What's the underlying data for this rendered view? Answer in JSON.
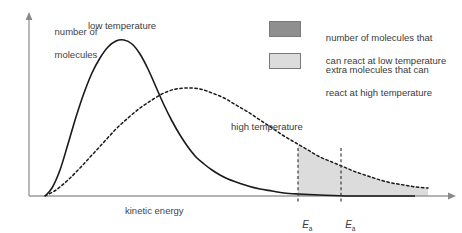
{
  "chart_data": {
    "type": "line",
    "title": "",
    "xlabel": "kinetic energy",
    "ylabel_line1": "number of",
    "ylabel_line2": "molecules",
    "grid": false,
    "legend_position": "top-right",
    "series": [
      {
        "name": "low temperature",
        "style": "solid",
        "color": "#1a1a1a",
        "label": "low temperature",
        "description": "Maxwell-Boltzmann distribution at low temperature: tall narrow peak at low kinetic energy",
        "peak_x": 118,
        "peak_y": 40,
        "points": [
          [
            45,
            196
          ],
          [
            52,
            188
          ],
          [
            60,
            170
          ],
          [
            68,
            144
          ],
          [
            76,
            117
          ],
          [
            84,
            93
          ],
          [
            92,
            73
          ],
          [
            100,
            58
          ],
          [
            108,
            47
          ],
          [
            116,
            41
          ],
          [
            124,
            40
          ],
          [
            132,
            44
          ],
          [
            140,
            54
          ],
          [
            148,
            69
          ],
          [
            156,
            87
          ],
          [
            164,
            105
          ],
          [
            172,
            121
          ],
          [
            180,
            135
          ],
          [
            188,
            147
          ],
          [
            196,
            157
          ],
          [
            204,
            164
          ],
          [
            212,
            170
          ],
          [
            220,
            175
          ],
          [
            228,
            179
          ],
          [
            236,
            182
          ],
          [
            248,
            186
          ],
          [
            260,
            189
          ],
          [
            272,
            191
          ],
          [
            284,
            193
          ],
          [
            298,
            194
          ],
          [
            320,
            195
          ],
          [
            350,
            196
          ],
          [
            380,
            196
          ],
          [
            415,
            196
          ]
        ]
      },
      {
        "name": "high temperature",
        "style": "dashed",
        "color": "#1a1a1a",
        "label": "high temperature",
        "description": "Maxwell-Boltzmann distribution at high temperature: lower broader peak shifted to higher kinetic energy",
        "peak_x": 175,
        "peak_y": 88,
        "points": [
          [
            45,
            196
          ],
          [
            56,
            190
          ],
          [
            68,
            180
          ],
          [
            80,
            168
          ],
          [
            92,
            155
          ],
          [
            104,
            142
          ],
          [
            116,
            129
          ],
          [
            128,
            118
          ],
          [
            140,
            108
          ],
          [
            152,
            100
          ],
          [
            164,
            93
          ],
          [
            176,
            89
          ],
          [
            188,
            88
          ],
          [
            200,
            89
          ],
          [
            212,
            93
          ],
          [
            224,
            98
          ],
          [
            236,
            105
          ],
          [
            248,
            112
          ],
          [
            260,
            120
          ],
          [
            272,
            128
          ],
          [
            284,
            136
          ],
          [
            296,
            143
          ],
          [
            308,
            150
          ],
          [
            320,
            157
          ],
          [
            332,
            162
          ],
          [
            344,
            167
          ],
          [
            356,
            172
          ],
          [
            368,
            176
          ],
          [
            380,
            180
          ],
          [
            392,
            183
          ],
          [
            404,
            185
          ],
          [
            416,
            187
          ],
          [
            428,
            188
          ]
        ]
      }
    ],
    "markers": [
      {
        "name": "Ea-low",
        "label": "E",
        "subscript": "a",
        "x": 298,
        "style": "dashed-vertical"
      },
      {
        "name": "Ea-high",
        "label": "E",
        "subscript": "a",
        "x": 341,
        "style": "dashed-vertical"
      }
    ],
    "shaded_regions": [
      {
        "name": "dark-region",
        "fill": "#8f8f8f",
        "description": "number of molecules that can react at low temperature",
        "from_x": 298,
        "to_x": 415
      },
      {
        "name": "light-region",
        "fill": "#dcdcdc",
        "description": "extra molecules that can react at high temperature",
        "from_x": 298,
        "to_x": 428
      }
    ]
  },
  "axes": {
    "x_axis_label": "kinetic energy",
    "y_axis_label_line1": "number of",
    "y_axis_label_line2": "molecules",
    "x_arrow": "right-arrow",
    "y_arrow": "up-arrow"
  },
  "curve_labels": {
    "low": "low temperature",
    "high": "high temperature"
  },
  "marker_labels": {
    "first_symbol": "E",
    "first_subscript": "a",
    "second_symbol": "E",
    "second_subscript": "a"
  },
  "legend": {
    "items": [
      {
        "swatch_color": "#8f8f8f",
        "line1": "number of molecules that",
        "line2": "can react at low temperature"
      },
      {
        "swatch_color": "#dcdcdc",
        "line1": "extra molecules that can",
        "line2": "react at high temperature"
      }
    ]
  },
  "colors": {
    "axis": "#9a9a9a",
    "curve": "#1a1a1a",
    "dark_fill": "#8f8f8f",
    "light_fill": "#dcdcdc",
    "text": "#3a3a3a"
  }
}
